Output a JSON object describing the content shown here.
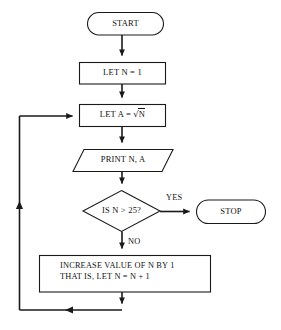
{
  "diagram": {
    "type": "flowchart",
    "line_color": "#1a1a1a",
    "fill_color": "#ffffff",
    "text_color": "#111111"
  },
  "nodes": {
    "start": {
      "shape": "terminal-oval",
      "label": "START"
    },
    "let_n": {
      "shape": "process-rectangle",
      "label": "LET N = 1"
    },
    "let_a": {
      "shape": "process-rectangle",
      "label_prefix": "LET A = ",
      "label_radical": "√",
      "label_radicand": "N",
      "label": "LET A = √N"
    },
    "print": {
      "shape": "io-parallelogram",
      "label": "PRINT N, A"
    },
    "decision": {
      "shape": "decision-diamond",
      "label": "IS N > 25?"
    },
    "stop": {
      "shape": "terminal-oval",
      "label": "STOP"
    },
    "increase": {
      "shape": "process-rectangle",
      "line1": "INCREASE VALUE OF N BY 1",
      "line2": "THAT IS, LET N = N + 1"
    }
  },
  "branch_labels": {
    "yes": "YES",
    "no": "NO"
  }
}
